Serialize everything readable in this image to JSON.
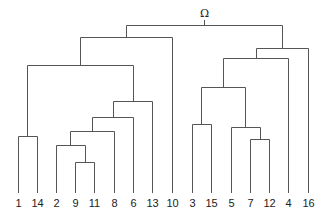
{
  "diagram": {
    "type": "dendrogram",
    "root_label": "Ω",
    "line_color": "#555555",
    "label_color": "#222222",
    "leaves": [
      {
        "label": "1",
        "x": 18
      },
      {
        "label": "14",
        "x": 37
      },
      {
        "label": "2",
        "x": 56
      },
      {
        "label": "9",
        "x": 75
      },
      {
        "label": "11",
        "x": 94
      },
      {
        "label": "8",
        "x": 114
      },
      {
        "label": "6",
        "x": 133
      },
      {
        "label": "13",
        "x": 152
      },
      {
        "label": "10",
        "x": 172
      },
      {
        "label": "3",
        "x": 192
      },
      {
        "label": "15",
        "x": 211
      },
      {
        "label": "5",
        "x": 231
      },
      {
        "label": "7",
        "x": 250
      },
      {
        "label": "12",
        "x": 269
      },
      {
        "label": "4",
        "x": 288
      },
      {
        "label": "16",
        "x": 308
      }
    ],
    "leaf_bottom_y": 193,
    "label_y": 207,
    "merges": [
      {
        "name": "9-11",
        "left_x": 75,
        "right_x": 94,
        "left_top": 193,
        "right_top": 193,
        "y": 162
      },
      {
        "name": "2-(9,11)",
        "left_x": 56,
        "right_x": 85,
        "left_top": 193,
        "right_top": 162,
        "y": 145
      },
      {
        "name": "(2,9,11)-8",
        "left_x": 70,
        "right_x": 114,
        "left_top": 145,
        "right_top": 193,
        "y": 131
      },
      {
        "name": "-6",
        "left_x": 92,
        "right_x": 133,
        "left_top": 131,
        "right_top": 193,
        "y": 117
      },
      {
        "name": "-13",
        "left_x": 113,
        "right_x": 152,
        "left_top": 117,
        "right_top": 193,
        "y": 101
      },
      {
        "name": "1-14",
        "left_x": 18,
        "right_x": 37,
        "left_top": 193,
        "right_top": 193,
        "y": 136
      },
      {
        "name": "(1,14)-(..13)",
        "left_x": 27,
        "right_x": 133,
        "left_top": 136,
        "right_top": 101,
        "y": 65
      },
      {
        "name": "-10",
        "left_x": 80,
        "right_x": 172,
        "left_top": 65,
        "right_top": 193,
        "y": 37
      },
      {
        "name": "3-15",
        "left_x": 192,
        "right_x": 211,
        "left_top": 193,
        "right_top": 193,
        "y": 124
      },
      {
        "name": "7-12",
        "left_x": 250,
        "right_x": 269,
        "left_top": 193,
        "right_top": 193,
        "y": 139
      },
      {
        "name": "5-(7,12)",
        "left_x": 231,
        "right_x": 260,
        "left_top": 193,
        "right_top": 139,
        "y": 127
      },
      {
        "name": "(3,15)-(5,7,12)",
        "left_x": 201,
        "right_x": 245,
        "left_top": 124,
        "right_top": 127,
        "y": 87
      },
      {
        "name": "-4",
        "left_x": 223,
        "right_x": 288,
        "left_top": 87,
        "right_top": 193,
        "y": 58
      },
      {
        "name": "-16",
        "left_x": 256,
        "right_x": 308,
        "left_top": 58,
        "right_top": 193,
        "y": 48
      },
      {
        "name": "root",
        "left_x": 126,
        "right_x": 282,
        "left_top": 37,
        "right_top": 48,
        "y": 25
      }
    ],
    "root_stem": {
      "x": 204,
      "y1": 25,
      "y2": 20
    },
    "root_label_pos": {
      "x": 204,
      "y": 17
    }
  }
}
